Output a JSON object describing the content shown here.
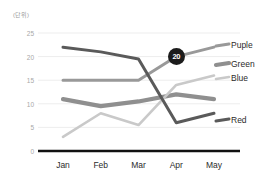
{
  "chart_data": {
    "type": "line",
    "title": "",
    "subtitle": "",
    "unit_label": "(단위)",
    "xlabel": "",
    "ylabel": "",
    "categories": [
      "Jan",
      "Feb",
      "Mar",
      "Apr",
      "May"
    ],
    "ylim": [
      0,
      25
    ],
    "yticks": [
      0,
      5,
      10,
      15,
      20,
      25
    ],
    "ytick_labels": [
      "0",
      "5",
      "10",
      "15",
      "20",
      "25"
    ],
    "grid": true,
    "legend_position": "right",
    "series": [
      {
        "name": "Puple",
        "color": "#999999",
        "width": 3.0,
        "values": [
          15,
          15,
          15,
          20,
          22
        ]
      },
      {
        "name": "Green",
        "color": "#8f8f8f",
        "width": 4.2,
        "values": [
          11,
          9.5,
          10.5,
          12,
          11
        ]
      },
      {
        "name": "Blue",
        "color": "#c9c9c9",
        "width": 2.6,
        "values": [
          3,
          8,
          5.5,
          14,
          16
        ]
      },
      {
        "name": "Red",
        "color": "#5a5a5a",
        "width": 3.0,
        "values": [
          22,
          21,
          19.5,
          6,
          8
        ]
      }
    ],
    "annotations": [
      {
        "label": "20",
        "series": "Puple",
        "category": "Apr",
        "value": 20,
        "style": "dark-circle-badge"
      }
    ]
  },
  "legend": {
    "items": [
      {
        "label": "Puple",
        "color": "#999999"
      },
      {
        "label": "Green",
        "color": "#8f8f8f"
      },
      {
        "label": "Blue",
        "color": "#c9c9c9"
      },
      {
        "label": "Red",
        "color": "#5a5a5a"
      }
    ]
  },
  "axis": {
    "x_axis_color": "#111111",
    "gridline_color": "#ededed"
  }
}
